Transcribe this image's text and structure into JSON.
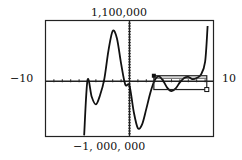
{
  "chart_data": {
    "type": "line",
    "title": "",
    "xlabel": "",
    "ylabel": "",
    "window": {
      "xmin": -10,
      "xmax": 10,
      "ymin": -1000000,
      "ymax": 1100000
    },
    "labels": {
      "xmin": "−10",
      "xmax": "10",
      "ymax": "1,100,000",
      "ymin": "−1, 000, 000"
    },
    "grid": false,
    "x_tick_step": 1,
    "series": [
      {
        "name": "f(x)",
        "x": [
          -5.4,
          -5.0,
          -4.5,
          -4.0,
          -3.5,
          -3.0,
          -2.5,
          -2.0,
          -1.5,
          -1.0,
          -0.5,
          0.0,
          0.5,
          1.0,
          1.5,
          2.0,
          2.5,
          3.0,
          3.5,
          4.0,
          4.5,
          5.0,
          5.5,
          6.0,
          6.5,
          7.0,
          7.5,
          8.0,
          8.5,
          9.0,
          9.3
        ],
        "y": [
          -980000,
          20000,
          -280000,
          -420000,
          -250000,
          40000,
          560000,
          910000,
          780000,
          320000,
          -60000,
          -80000,
          -550000,
          -850000,
          -780000,
          -500000,
          -200000,
          20000,
          90000,
          10000,
          -120000,
          -180000,
          -130000,
          -20000,
          60000,
          80000,
          40000,
          60000,
          120000,
          350000,
          1000000
        ]
      }
    ],
    "trace_box": {
      "x1": 2.9,
      "x2": 9.2,
      "y1": 100000,
      "y2": -150000
    }
  }
}
